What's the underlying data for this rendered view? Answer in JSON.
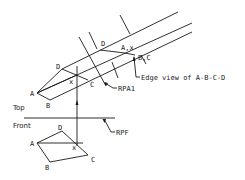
{
  "diagram": {
    "views": {
      "top": {
        "label": "Top",
        "points": {
          "A": {
            "label": "A",
            "x": 37,
            "y": 93
          },
          "B": {
            "label": "B",
            "x": 50,
            "y": 100
          },
          "C": {
            "label": "C",
            "x": 88,
            "y": 80
          },
          "D": {
            "label": "D",
            "x": 62,
            "y": 69
          },
          "X": {
            "label": "x",
            "x": 73,
            "y": 80
          }
        }
      },
      "front": {
        "label": "Front",
        "points": {
          "A": {
            "label": "A",
            "x": 37,
            "y": 143
          },
          "B": {
            "label": "B",
            "x": 50,
            "y": 162
          },
          "C": {
            "label": "C",
            "x": 88,
            "y": 155
          },
          "D": {
            "label": "D",
            "x": 62,
            "y": 131
          },
          "X": {
            "label": "x",
            "x": 73,
            "y": 145
          }
        }
      },
      "auxiliary": {
        "points": {
          "D": {
            "label": "D",
            "x": 100,
            "y": 50
          },
          "AX": {
            "label": "A,x",
            "x": 125,
            "y": 52
          },
          "BC": {
            "label": "B,C",
            "x": 135,
            "y": 55
          }
        }
      }
    },
    "reference_planes": {
      "rpa1": {
        "label": "RPA1"
      },
      "rpf": {
        "label": "RPF"
      }
    },
    "annotations": {
      "edge_view": {
        "label": "Edge view of A-B-C-D"
      }
    },
    "colors": {
      "line": "#1a1a1a",
      "background": "#ffffff"
    }
  }
}
